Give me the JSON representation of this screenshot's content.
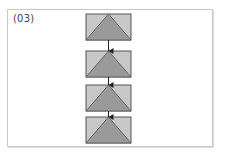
{
  "figure": {
    "label": "(03)",
    "colors": {
      "box_fill": "#c8c8c8",
      "triangle_fill": "#9a9a9a",
      "stroke": "#555555",
      "arrow": "#222222",
      "frame": "#c8c8c8"
    },
    "nodes": [
      {
        "id": "box-1",
        "x": 86,
        "y": 14,
        "w": 45,
        "h": 26
      },
      {
        "id": "box-2",
        "x": 86,
        "y": 51,
        "w": 45,
        "h": 26
      },
      {
        "id": "box-3",
        "x": 86,
        "y": 85,
        "w": 45,
        "h": 26
      },
      {
        "id": "box-4",
        "x": 86,
        "y": 117,
        "w": 45,
        "h": 26
      }
    ],
    "edges": [
      {
        "from": "box-1",
        "to": "box-2"
      },
      {
        "from": "box-2",
        "to": "box-3"
      },
      {
        "from": "box-3",
        "to": "box-4"
      }
    ]
  }
}
